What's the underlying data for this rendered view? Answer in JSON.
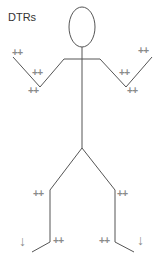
{
  "title": "DTRs",
  "reflexes": {
    "left_biceps": "++",
    "left_brachioradialis": "++",
    "left_triceps": "++",
    "right_biceps": "++",
    "right_brachioradialis": "++",
    "right_triceps": "++",
    "left_patellar": "++",
    "right_patellar": "++",
    "left_achilles": "++",
    "right_achilles": "++"
  },
  "plantar": {
    "left": "↓",
    "right": "↓"
  },
  "colors": {
    "line": "#555555",
    "label": "#8a8a8a"
  }
}
